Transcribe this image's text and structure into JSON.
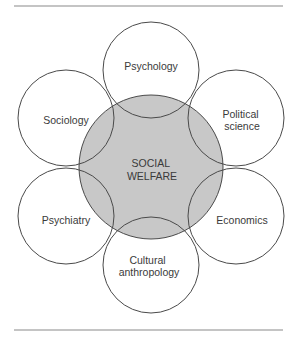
{
  "diagram": {
    "type": "overlapping-circles",
    "center": {
      "label_lines": [
        "SOCIAL",
        "WELFARE"
      ],
      "fill": "#c8c8c8"
    },
    "disciplines": [
      {
        "id": "psychology",
        "label_lines": [
          "Psychology"
        ]
      },
      {
        "id": "political-science",
        "label_lines": [
          "Political",
          "science"
        ]
      },
      {
        "id": "economics",
        "label_lines": [
          "Economics"
        ]
      },
      {
        "id": "cultural-anthropology",
        "label_lines": [
          "Cultural",
          "anthropology"
        ]
      },
      {
        "id": "psychiatry",
        "label_lines": [
          "Psychiatry"
        ]
      },
      {
        "id": "sociology",
        "label_lines": [
          "Sociology"
        ]
      }
    ],
    "stroke_color": "#4a4a4a",
    "rule_color": "#8a8a8a"
  }
}
